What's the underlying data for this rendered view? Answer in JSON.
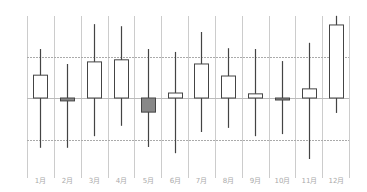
{
  "chart_data": {
    "type": "candlestick",
    "title": "",
    "xlabel": "",
    "ylabel": "",
    "categories": [
      "1月",
      "2月",
      "3月",
      "4月",
      "5月",
      "6月",
      "7月",
      "8月",
      "9月",
      "10月",
      "11月",
      "12月"
    ],
    "series": [
      {
        "name": "price",
        "open": [
          100,
          100,
          100,
          100,
          100,
          100,
          100,
          100,
          100,
          100,
          100,
          100
        ],
        "close": [
          105.5,
          99.3,
          108.7,
          109.2,
          96.6,
          101.2,
          108.2,
          105.3,
          101.0,
          99.8,
          102.2,
          117.6
        ],
        "high": [
          111.8,
          108.2,
          117.8,
          117.3,
          111.8,
          111.1,
          115.9,
          112.0,
          111.8,
          108.9,
          113.3,
          119.8
        ],
        "low": [
          88.0,
          88.0,
          90.8,
          93.3,
          88.2,
          86.7,
          91.8,
          92.8,
          90.8,
          91.3,
          85.3,
          96.4
        ]
      }
    ],
    "ylim": [
      80,
      120
    ],
    "reference_lines": [
      {
        "value": 110,
        "style": "dashed"
      },
      {
        "value": 100,
        "style": "solid"
      },
      {
        "value": 90,
        "style": "dashed"
      }
    ],
    "grid": {
      "vertical": true,
      "horizontal": false
    },
    "legend": null,
    "colors": {
      "up_fill": "#ffffff",
      "down_fill": "#888888",
      "outline": "#444444",
      "grid": "#cccccc",
      "label": "#aaaaaa"
    }
  }
}
